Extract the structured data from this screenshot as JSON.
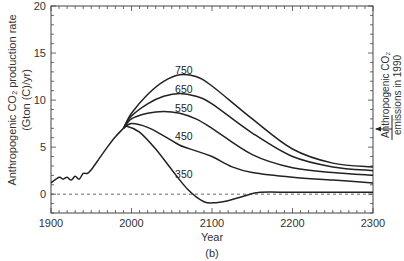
{
  "chart_data": {
    "type": "line",
    "title": "",
    "panel_label": "(b)",
    "xlabel": "Year",
    "ylabel": "Anthropogenic CO2 production rate (Gton (C)/yr)",
    "ylabel_line1": "Anthropogenic CO₂ production rate",
    "ylabel_line2": "(Gton (C)/yr)",
    "xlim": [
      1900,
      2300
    ],
    "ylim": [
      -2,
      20
    ],
    "xticks": [
      1900,
      2000,
      2100,
      2200,
      2300
    ],
    "yticks": [
      0,
      5,
      10,
      15,
      20
    ],
    "grid": false,
    "reference_line": {
      "y": 0,
      "style": "dashed"
    },
    "annotation": {
      "text_line1": "Anthropogenic CO₂",
      "text_line2": "emissions in 1990",
      "value": 7,
      "arrow": "left-pointing at right axis"
    },
    "historical": {
      "name": "Historical",
      "x": [
        1900,
        1910,
        1915,
        1920,
        1925,
        1930,
        1935,
        1940,
        1945,
        1950,
        1960,
        1970,
        1980,
        1990
      ],
      "y": [
        1.2,
        1.8,
        1.6,
        1.8,
        1.5,
        1.9,
        1.6,
        2.2,
        2.2,
        2.6,
        3.8,
        5.0,
        6.1,
        7.0
      ]
    },
    "series": [
      {
        "name": "750",
        "x": [
          1990,
          2000,
          2020,
          2040,
          2060,
          2080,
          2100,
          2150,
          2200,
          2250,
          2300
        ],
        "y": [
          7.0,
          8.6,
          10.6,
          12.0,
          12.7,
          12.5,
          11.5,
          8.0,
          4.8,
          3.3,
          2.9
        ]
      },
      {
        "name": "650",
        "x": [
          1990,
          2000,
          2020,
          2040,
          2060,
          2080,
          2100,
          2150,
          2200,
          2250,
          2300
        ],
        "y": [
          7.0,
          8.3,
          9.6,
          10.4,
          10.7,
          10.4,
          9.6,
          6.5,
          4.0,
          2.9,
          2.5
        ]
      },
      {
        "name": "550",
        "x": [
          1990,
          2000,
          2020,
          2040,
          2060,
          2080,
          2100,
          2150,
          2200,
          2250,
          2300
        ],
        "y": [
          7.0,
          8.0,
          8.6,
          8.8,
          8.6,
          8.0,
          7.0,
          4.2,
          2.8,
          2.3,
          2.0
        ]
      },
      {
        "name": "450",
        "x": [
          1990,
          2000,
          2020,
          2040,
          2060,
          2080,
          2100,
          2125,
          2150,
          2200,
          2250,
          2300
        ],
        "y": [
          7.0,
          7.5,
          7.1,
          6.2,
          5.2,
          4.6,
          4.0,
          2.9,
          2.3,
          1.8,
          1.5,
          1.2
        ]
      },
      {
        "name": "350",
        "x": [
          1990,
          1995,
          2010,
          2030,
          2050,
          2070,
          2090,
          2105,
          2120,
          2140,
          2160,
          2200,
          2250,
          2300
        ],
        "y": [
          7.0,
          7.2,
          6.6,
          4.8,
          2.6,
          0.5,
          -0.8,
          -0.9,
          -0.7,
          -0.2,
          0.2,
          0.2,
          0.2,
          0.2
        ]
      }
    ],
    "label_positions": {
      "750": {
        "x": 2065,
        "y": 13.2
      },
      "650": {
        "x": 2065,
        "y": 11.2
      },
      "550": {
        "x": 2065,
        "y": 9.2
      },
      "450": {
        "x": 2065,
        "y": 6.2
      },
      "350": {
        "x": 2065,
        "y": 2.1
      }
    }
  }
}
